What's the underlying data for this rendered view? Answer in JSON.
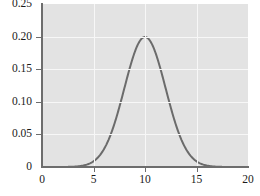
{
  "chart_data": {
    "type": "line",
    "title": "",
    "subtitle": "",
    "xlabel": "",
    "ylabel": "",
    "xlim": [
      0,
      20
    ],
    "ylim": [
      0,
      0.25
    ],
    "xticks": [
      0,
      5,
      10,
      15,
      20
    ],
    "yticks": [
      0,
      0.05,
      0.1,
      0.15,
      0.2,
      0.25
    ],
    "xtick_labels": [
      "0",
      "5",
      "10",
      "15",
      "20"
    ],
    "ytick_labels": [
      "0",
      "0.05",
      "0.10",
      "0.15",
      "0.20",
      "0.25"
    ],
    "grid": true,
    "grid_color": "#f7f7f7",
    "panel_background": "#e3e3e3",
    "legend": null,
    "annotations": [],
    "series": [
      {
        "name": "normal density (mean 10, sd 2)",
        "color": "#6b6b6b",
        "line_width": 2,
        "distribution": "normal",
        "mean": 10,
        "sd": 2,
        "peak_x": 10,
        "peak_y": 0.1995,
        "x": [
          0,
          0.5,
          1,
          1.5,
          2,
          2.5,
          3,
          3.5,
          4,
          4.5,
          5,
          5.5,
          6,
          6.5,
          7,
          7.5,
          8,
          8.5,
          9,
          9.5,
          10,
          10.5,
          11,
          11.5,
          12,
          12.5,
          13,
          13.5,
          14,
          14.5,
          15,
          15.5,
          16,
          16.5,
          17,
          17.5,
          18,
          18.5,
          19,
          19.5,
          20
        ],
        "y": [
          0.0,
          0.0,
          0.0,
          0.0001,
          0.0002,
          0.0004,
          0.0009,
          0.0018,
          0.0033,
          0.0058,
          0.0088,
          0.013,
          0.018,
          0.0236,
          0.0302,
          0.0372,
          0.044,
          0.0506,
          0.056,
          0.06,
          0.0621,
          0.06,
          0.056,
          0.0506,
          0.044,
          0.0372,
          0.0302,
          0.0236,
          0.018,
          0.013,
          0.0088,
          0.0058,
          0.0033,
          0.0018,
          0.0009,
          0.0004,
          0.0002,
          0.0001,
          0.0,
          0.0,
          0.0
        ]
      }
    ]
  },
  "axes": {
    "axis_color": "#6d6d6d",
    "tick_color": "#6d6d6d",
    "label_color": "#1a1a1a"
  }
}
